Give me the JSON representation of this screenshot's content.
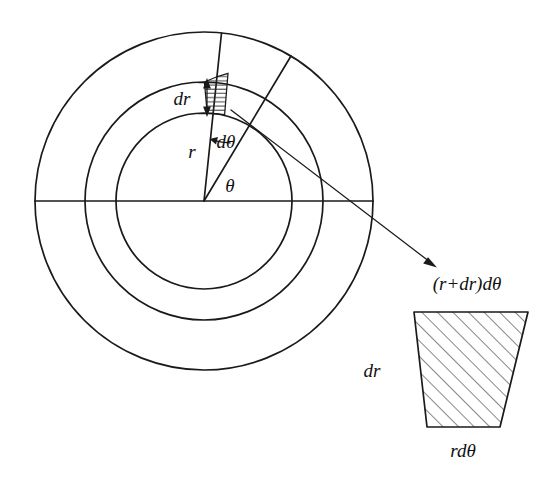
{
  "figure": {
    "background_color": "#ffffff",
    "line_color": "#1a1a1a"
  },
  "labels": {
    "dr_inner": "dr",
    "d_theta": "dθ",
    "r": "r",
    "theta": "θ",
    "outer_arc": "(r+dr)dθ",
    "dr_trapezoid": "dr",
    "inner_arc": "rdθ"
  },
  "geometry": {
    "center": {
      "x": 204,
      "y": 201
    },
    "circles": [
      {
        "name": "inner-circle",
        "radius": 88
      },
      {
        "name": "middle-circle",
        "radius": 119
      },
      {
        "name": "outer-circle",
        "radius": 169
      }
    ],
    "horizontal_radius_line": {
      "x1": 35,
      "y1": 201,
      "x2": 373,
      "y2": 201
    },
    "radial_lines": [
      {
        "name": "radial-line-first",
        "angle_deg": 99
      },
      {
        "name": "radial-line-second",
        "angle_deg": 77
      }
    ],
    "angle_arc": {
      "label": "dθ",
      "radius": 62
    },
    "pointer_arrow": {
      "x1": 246,
      "y1": 112,
      "x2": 436,
      "y2": 266
    },
    "trapezoid": {
      "top_left": {
        "x": 414,
        "y": 312
      },
      "top_right": {
        "x": 528,
        "y": 312
      },
      "bottom_right": {
        "x": 500,
        "y": 427
      },
      "bottom_left": {
        "x": 427,
        "y": 427
      },
      "hatch_direction": "diagonal-up-right"
    },
    "element_hatch_direction": "horizontal"
  }
}
